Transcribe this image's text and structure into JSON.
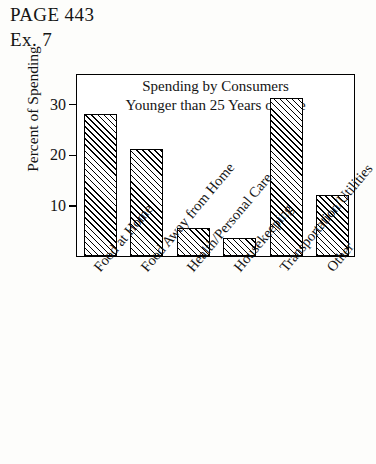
{
  "header": {
    "page_label": "PAGE 443",
    "exercise_label": "Ex. 7"
  },
  "chart_data": {
    "type": "bar",
    "title": "Spending by Consumers Younger than 25 Years of Age",
    "title_lines": [
      "Spending by Consumers",
      "Younger than 25 Years of Age"
    ],
    "xlabel": "",
    "ylabel": "Percent of Spending",
    "categories": [
      "Food at Home",
      "Food Away from Home",
      "Health/Personal Care",
      "Housekeeping",
      "Transportation/Utilities",
      "Other"
    ],
    "values": [
      28,
      21,
      5.5,
      3.5,
      31,
      12
    ],
    "ylim": [
      0,
      36
    ],
    "yticks": [
      10,
      20,
      30
    ],
    "ytick_labels": [
      "10",
      "20",
      "30"
    ],
    "grid": false,
    "legend": null,
    "bar_style": {
      "fill": "#ffffff",
      "hatch": "diagonal-45",
      "edge_color": "#000000"
    }
  }
}
